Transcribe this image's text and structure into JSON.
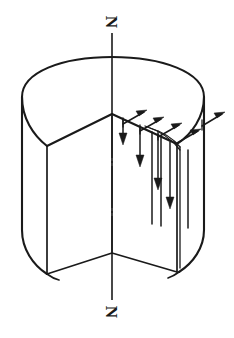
{
  "figure": {
    "title": "Cylinder with wedge sector removed and magnetization vector field",
    "canvas": {
      "width": 234,
      "height": 338,
      "background": "#ffffff"
    },
    "ink_color": "#1a1a1a",
    "labels": {
      "north_pole_top": "N",
      "north_pole_bottom": "N"
    },
    "axis": {
      "name": "vertical-symmetry-axis",
      "style": "dash-dot",
      "x": 112,
      "top_y": 22,
      "bottom_y": 316
    },
    "body": {
      "name": "cylinder-with-wedge-cutout",
      "top_ellipse": {
        "cx": 112,
        "cy": 96,
        "rx": 91,
        "ry": 39
      },
      "left_silhouette_x": 22,
      "right_silhouette_x": 204,
      "barrel_bottom_y": 262,
      "wedge_apex": {
        "x": 112,
        "y": 114
      },
      "wedge_left_corner": {
        "x": 47,
        "y": 152
      },
      "wedge_right_corner": {
        "x": 176,
        "y": 148
      },
      "wedge_bottom_apex": {
        "x": 112,
        "y": 253
      }
    },
    "vectors": {
      "name": "magnetization-arrows",
      "up_right_arrow_count": 4,
      "down_arrow_count": 5,
      "right_edge_arrow_count": 1,
      "direction_upper": "up-and-to-the-right along radial top edge",
      "direction_lower": "downward parallel to the axis"
    }
  }
}
